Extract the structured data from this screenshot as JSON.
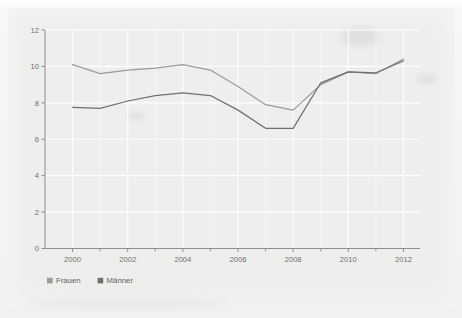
{
  "chart_data": {
    "type": "line",
    "title": "",
    "xlabel": "",
    "ylabel": "",
    "x": [
      2000,
      2001,
      2002,
      2003,
      2004,
      2005,
      2006,
      2007,
      2008,
      2009,
      2010,
      2011,
      2012
    ],
    "series": [
      {
        "name": "Frauen",
        "color": "#9a9a9a",
        "values": [
          10.1,
          9.6,
          9.8,
          9.9,
          10.1,
          9.8,
          8.9,
          7.9,
          7.6,
          9.0,
          9.7,
          9.6,
          10.4
        ]
      },
      {
        "name": "Männer",
        "color": "#6f6f6f",
        "values": [
          7.75,
          7.7,
          8.1,
          8.4,
          8.55,
          8.4,
          7.6,
          6.6,
          6.6,
          9.1,
          9.7,
          9.65,
          10.3
        ]
      }
    ],
    "xlim": [
      1999,
      2012.6
    ],
    "ylim": [
      0,
      12
    ],
    "yticks": [
      0,
      2,
      4,
      6,
      8,
      10,
      12
    ],
    "ytick_labels": [
      "0",
      "2",
      "4",
      "6",
      "8",
      "10",
      "12"
    ],
    "xticks": [
      2000,
      2002,
      2004,
      2006,
      2008,
      2010,
      2012
    ],
    "xtick_labels": [
      "2000",
      "2002",
      "2004",
      "2006",
      "2008",
      "2010",
      "2012"
    ],
    "xticks_minor": [
      2001,
      2003,
      2005,
      2007,
      2009,
      2011
    ],
    "grid": true,
    "grid_color": "#ffffff",
    "legend_position": "bottom-left",
    "background_color": "#eeeeec",
    "axis_color": "#8d8d8d"
  },
  "legend": {
    "items": [
      {
        "label": "Frauen",
        "color": "#9a9a9a"
      },
      {
        "label": "Männer",
        "color": "#6f6f6f"
      }
    ]
  },
  "axes": {
    "y_tick_labels": [
      "12",
      "10",
      "8",
      "6",
      "4",
      "2",
      "0"
    ],
    "x_tick_labels": [
      "2000",
      "2002",
      "2004",
      "2006",
      "2008",
      "2010",
      "2012"
    ]
  }
}
